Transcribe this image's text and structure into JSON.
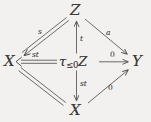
{
  "figure": {
    "kind": "commutative-diagram",
    "shape": "diamond",
    "background_color": "#f2f1ef",
    "ink_color": "#3c3a38"
  },
  "vertices": {
    "top": "Z",
    "left": "X",
    "right": "Y",
    "bottom": "X",
    "center_tau": "τ",
    "center_sub": "≤0",
    "center_obj": "Z"
  },
  "edges": [
    {
      "id": "z-to-x",
      "label": "s",
      "style": "double",
      "from": "top",
      "to": "left"
    },
    {
      "id": "z-to-y",
      "label": "a",
      "style": "single",
      "from": "top",
      "to": "right"
    },
    {
      "id": "tau-to-z",
      "label": "t",
      "style": "single",
      "from": "center",
      "to": "top"
    },
    {
      "id": "tau-to-x-left",
      "label": "st",
      "style": "double",
      "from": "center",
      "to": "left"
    },
    {
      "id": "tau-to-y",
      "label": "0",
      "style": "single",
      "from": "center",
      "to": "right"
    },
    {
      "id": "tau-to-x-bot",
      "label": "st",
      "style": "single",
      "from": "center",
      "to": "bottom"
    },
    {
      "id": "x-to-x",
      "label": "",
      "style": "double",
      "from": "left",
      "to": "bottom"
    },
    {
      "id": "x-to-y",
      "label": "0",
      "style": "single",
      "from": "bottom",
      "to": "right"
    }
  ],
  "edge_labels": {
    "s": "s",
    "a": "a",
    "t": "t",
    "st_left": "st",
    "zero_right": "0",
    "st_bottom": "st",
    "zero_bottom": "0"
  }
}
